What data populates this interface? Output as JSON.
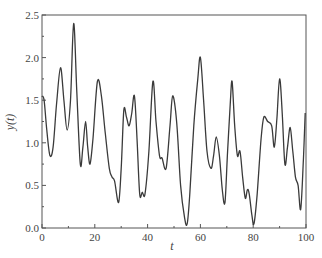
{
  "chart_data": {
    "type": "line",
    "title": "",
    "xlabel": "t",
    "ylabel": "y(t)",
    "xlim": [
      0,
      100
    ],
    "ylim": [
      0.0,
      2.5
    ],
    "xticks": [
      "0",
      "20",
      "40",
      "60",
      "80",
      "100"
    ],
    "yticks": [
      "0.0",
      "0.5",
      "1.0",
      "1.5",
      "2.0",
      "2.5"
    ],
    "grid": false,
    "legend": null,
    "series": [
      {
        "name": "y(t)",
        "color": "#3a3a3a",
        "x": [
          0,
          0.8,
          1.8,
          3,
          4.2,
          5.5,
          7,
          8.3,
          9.5,
          10.8,
          12,
          13.2,
          14.5,
          15.5,
          16.5,
          17.3,
          18.2,
          19.3,
          21,
          22.5,
          24,
          25.5,
          26.5,
          27.5,
          29,
          30,
          31,
          32,
          33,
          34,
          35,
          36,
          37,
          38,
          39,
          40.5,
          42,
          43.2,
          44.5,
          45.5,
          47,
          48.5,
          49.5,
          51,
          52.5,
          54,
          55,
          56,
          57.5,
          59,
          60,
          61.2,
          62.5,
          64,
          65,
          66,
          67.2,
          68.3,
          69.3,
          70.3,
          71.3,
          72,
          73,
          74,
          75,
          76,
          77,
          77.8,
          78.5,
          79.5,
          80.3,
          81.5,
          83,
          84,
          85.5,
          87,
          88,
          89,
          90,
          91,
          92,
          93,
          94,
          95,
          96,
          97,
          98,
          99,
          99.7
        ],
        "values": [
          1.55,
          1.5,
          1.15,
          0.85,
          0.95,
          1.45,
          1.88,
          1.5,
          1.15,
          1.5,
          2.4,
          1.6,
          0.75,
          0.95,
          1.25,
          0.95,
          0.75,
          1.05,
          1.72,
          1.55,
          1.1,
          0.7,
          0.6,
          0.55,
          0.3,
          0.7,
          1.38,
          1.3,
          1.2,
          1.35,
          1.55,
          1.05,
          0.4,
          0.42,
          0.4,
          0.9,
          1.72,
          1.25,
          0.85,
          0.82,
          0.7,
          1.2,
          1.55,
          1.25,
          0.5,
          0.12,
          0.05,
          0.4,
          1.2,
          1.75,
          2.0,
          1.5,
          0.9,
          0.7,
          0.85,
          1.07,
          0.85,
          0.45,
          0.3,
          0.9,
          1.45,
          1.72,
          1.2,
          0.85,
          0.9,
          0.6,
          0.35,
          0.45,
          0.4,
          0.15,
          0.05,
          0.4,
          1.05,
          1.3,
          1.25,
          1.2,
          0.95,
          1.3,
          1.75,
          1.35,
          0.75,
          0.95,
          1.18,
          0.9,
          0.6,
          0.5,
          0.22,
          0.8,
          1.35
        ]
      }
    ]
  }
}
